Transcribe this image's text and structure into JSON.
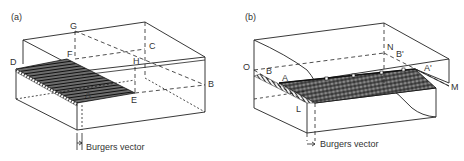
{
  "figure": {
    "panels": [
      {
        "id": "a",
        "tag": "(a)",
        "caption_label": "Burgers vector",
        "point_labels": {
          "G": "G",
          "F": "F",
          "C": "C",
          "D": "D",
          "H": "H",
          "A": "A",
          "E": "E",
          "B": "B"
        },
        "description": "Edge dislocation: crystal block with slipped region ABCD-type half-plane; dislocation line AE"
      },
      {
        "id": "b",
        "tag": "(b)",
        "caption_label": "Burgers vector",
        "point_labels": {
          "O": "O",
          "B": "B",
          "A": "A",
          "N": "N",
          "Bp": "B'",
          "Ap": "A'",
          "M": "M",
          "L": "L"
        },
        "description": "Screw dislocation: crystal block sheared along plane LMNO; dislocation line AA'"
      }
    ],
    "colors": {
      "line": "#222222",
      "hatch": "#333333",
      "background": "#ffffff"
    }
  }
}
